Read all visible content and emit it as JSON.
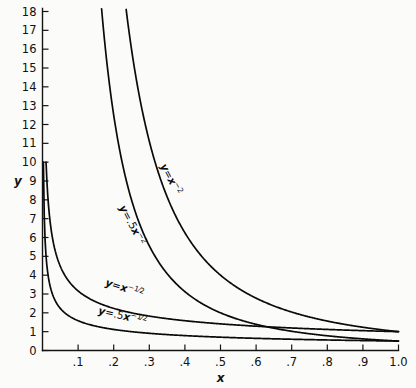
{
  "chart_data": {
    "type": "line",
    "title": "",
    "subtitle": "",
    "xlabel": "x",
    "ylabel": "y",
    "xlim": [
      0.0,
      1.0
    ],
    "ylim": [
      0,
      18
    ],
    "grid": false,
    "legend_position": "inline-curve-labels",
    "x_ticks": [
      ".1",
      ".2",
      ".3",
      ".4",
      ".5",
      ".6",
      ".7",
      ".8",
      ".9",
      "1.0"
    ],
    "x_tick_values": [
      0.1,
      0.2,
      0.3,
      0.4,
      0.5,
      0.6,
      0.7,
      0.8,
      0.9,
      1.0
    ],
    "y_ticks": [
      "0",
      "1",
      "2",
      "3",
      "4",
      "5",
      "6",
      "7",
      "8",
      "9",
      "10",
      "11",
      "12",
      "13",
      "14",
      "15",
      "16",
      "17",
      "18"
    ],
    "y_tick_values": [
      0,
      1,
      2,
      3,
      4,
      5,
      6,
      7,
      8,
      9,
      10,
      11,
      12,
      13,
      14,
      15,
      16,
      17,
      18
    ],
    "series": [
      {
        "name": "y = x^-2",
        "label_parts": {
          "lhs": "y",
          "eq": "=",
          "base": "x",
          "exp": "−2"
        },
        "coefficient": 1.0,
        "exponent": -2,
        "label_x": 0.33,
        "label_y": 9.8,
        "label_rotation": 62,
        "x": [
          0.235,
          0.25,
          0.275,
          0.3,
          0.325,
          0.35,
          0.4,
          0.45,
          0.5,
          0.55,
          0.6,
          0.65,
          0.7,
          0.75,
          0.8,
          0.85,
          0.9,
          0.95,
          1.0
        ],
        "y": [
          18.1,
          16.0,
          13.22,
          11.11,
          9.47,
          8.16,
          6.25,
          4.94,
          4.0,
          3.31,
          2.78,
          2.37,
          2.04,
          1.78,
          1.56,
          1.38,
          1.23,
          1.11,
          1.0
        ]
      },
      {
        "name": "y = .5x^-2",
        "label_parts": {
          "lhs": "y",
          "eq": "=",
          "coef": ".5",
          "base": "x",
          "exp": "−2"
        },
        "coefficient": 0.5,
        "exponent": -2,
        "label_x": 0.215,
        "label_y": 7.6,
        "label_rotation": 62,
        "x": [
          0.166,
          0.18,
          0.2,
          0.225,
          0.25,
          0.275,
          0.3,
          0.35,
          0.4,
          0.45,
          0.5,
          0.55,
          0.6,
          0.65,
          0.7,
          0.75,
          0.8,
          0.85,
          0.9,
          0.95,
          1.0
        ],
        "y": [
          18.15,
          15.43,
          12.5,
          9.88,
          8.0,
          6.61,
          5.56,
          4.08,
          3.13,
          2.47,
          2.0,
          1.65,
          1.39,
          1.18,
          1.02,
          0.89,
          0.78,
          0.69,
          0.62,
          0.55,
          0.5
        ]
      },
      {
        "name": "y = x^-1/2",
        "label_parts": {
          "lhs": "y",
          "eq": "=",
          "base": "x",
          "exp_sign": "−",
          "exp_num": "1",
          "exp_den": "2"
        },
        "coefficient": 1.0,
        "exponent": -0.5,
        "label_x": 0.175,
        "label_y": 3.45,
        "label_rotation": 18,
        "x": [
          0.01,
          0.012,
          0.015,
          0.02,
          0.025,
          0.03,
          0.04,
          0.05,
          0.07,
          0.09,
          0.12,
          0.15,
          0.2,
          0.25,
          0.3,
          0.35,
          0.4,
          0.45,
          0.5,
          0.6,
          0.7,
          0.8,
          0.9,
          1.0
        ],
        "y": [
          10.0,
          9.13,
          8.16,
          7.07,
          6.32,
          5.77,
          5.0,
          4.47,
          3.78,
          3.33,
          2.89,
          2.58,
          2.24,
          2.0,
          1.83,
          1.69,
          1.58,
          1.49,
          1.41,
          1.29,
          1.2,
          1.12,
          1.05,
          1.0
        ]
      },
      {
        "name": "y = .5x^-1/2",
        "label_parts": {
          "lhs": "y",
          "eq": "=",
          "coef": ".5",
          "base": "x",
          "exp_sign": "−",
          "exp_num": "1",
          "exp_den": "2"
        },
        "coefficient": 0.5,
        "exponent": -0.5,
        "label_x": 0.155,
        "label_y": 1.95,
        "label_rotation": 13,
        "x": [
          0.0025,
          0.003,
          0.004,
          0.005,
          0.007,
          0.01,
          0.015,
          0.02,
          0.03,
          0.04,
          0.06,
          0.08,
          0.1,
          0.15,
          0.2,
          0.25,
          0.3,
          0.4,
          0.5,
          0.6,
          0.7,
          0.8,
          0.9,
          1.0
        ],
        "y": [
          10.0,
          9.13,
          7.91,
          7.07,
          5.98,
          5.0,
          4.08,
          3.54,
          2.89,
          2.5,
          2.04,
          1.77,
          1.58,
          1.29,
          1.12,
          1.0,
          0.91,
          0.79,
          0.71,
          0.65,
          0.6,
          0.56,
          0.53,
          0.5
        ]
      }
    ]
  }
}
